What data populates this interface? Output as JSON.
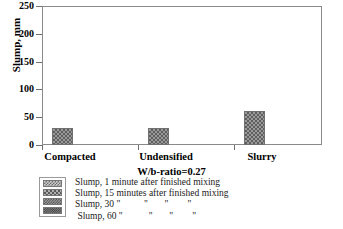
{
  "chart_data": {
    "type": "bar",
    "title": "",
    "xlabel": "W/b-ratio=0.27",
    "ylabel": "Slump, mm",
    "categories": [
      "Compacted",
      "Undensified",
      "Slurry"
    ],
    "ylim": [
      0,
      250
    ],
    "yticks": [
      0,
      50,
      100,
      150,
      200,
      250
    ],
    "grid": false,
    "legend_position": "below-left",
    "series": [
      {
        "name": "Slump, 1 minute after finished mixing",
        "values": [
          30,
          31,
          62
        ]
      },
      {
        "name": "Slump, 15 minutes after finished mixing",
        "values": [
          0,
          0,
          0
        ]
      },
      {
        "name": "Slump, 30 \"          \"       \"        \"",
        "values": [
          0,
          0,
          0
        ]
      },
      {
        "name": " Slump, 60 \"           \"       \"        \"",
        "values": [
          0,
          0,
          0
        ]
      }
    ]
  },
  "axis": {
    "y_title": "Slump, mm",
    "x_title": "W/b-ratio=0.27",
    "tick_250": "250",
    "tick_200": "200",
    "tick_150": "150",
    "tick_100": "100",
    "tick_50": "50",
    "tick_0": "0"
  },
  "categories": {
    "c0": "Compacted",
    "c1": "Undensified",
    "c2": "Slurry"
  },
  "legend": {
    "items": [
      {
        "label": "Slump, 1 minute after finished mixing",
        "swatch": "checker-light"
      },
      {
        "label": "Slump, 15 minutes after finished mixing",
        "swatch": "checker-medium"
      },
      {
        "label": "Slump, 30 \"          \"       \"        \"",
        "swatch": "checker-dense"
      },
      {
        "label": " Slump, 60 \"           \"       \"        \"",
        "swatch": "checker-dark"
      }
    ]
  },
  "colors": {
    "frame": "#8a8a8a",
    "bar_fill": "#9a9a9a",
    "bar_pattern": "#5e5e5e",
    "text": "#000000",
    "background": "#ffffff"
  }
}
